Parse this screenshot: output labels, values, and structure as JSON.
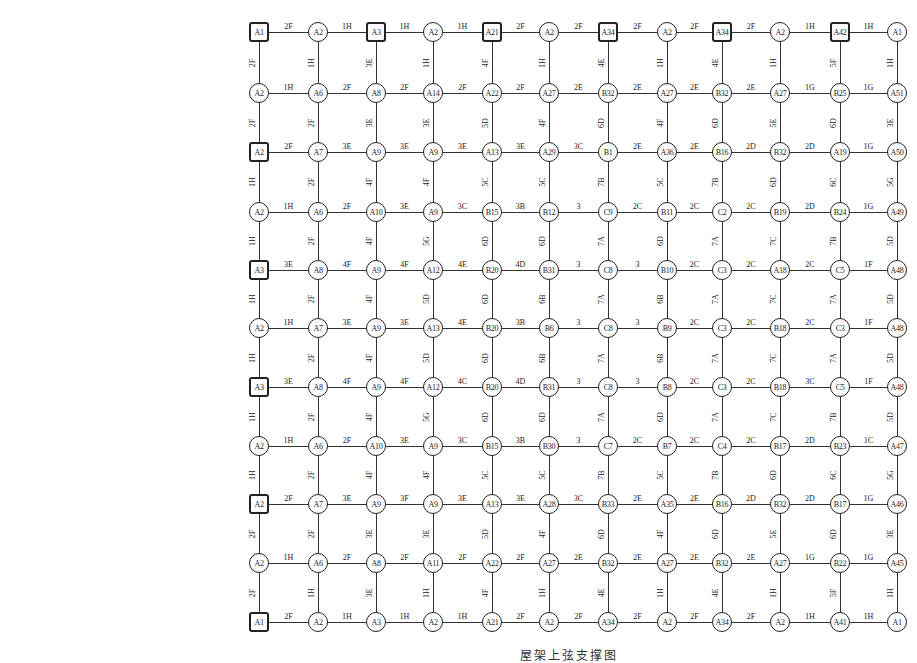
{
  "diagram": {
    "caption": "屋架上弦支撑图",
    "columns_x": [
      259,
      318,
      376,
      433,
      492,
      549,
      608,
      667,
      722,
      780,
      840,
      897
    ],
    "rows_y": [
      32,
      93,
      152,
      212,
      270,
      328,
      387,
      446,
      504,
      563,
      622
    ],
    "nodes": [
      [
        "A1",
        "A2",
        "A3",
        "A2",
        "A21",
        "A2",
        "A34",
        "A2",
        "A34",
        "A2",
        "A42",
        "A1"
      ],
      [
        "A2",
        "A6",
        "A8",
        "A14",
        "A22",
        "A27",
        "B32",
        "A27",
        "B32",
        "A27",
        "B25",
        "A51"
      ],
      [
        "A2",
        "A7",
        "A9",
        "A9",
        "A13",
        "A29",
        "B1",
        "A36",
        "B16",
        "B32",
        "A19",
        "A50"
      ],
      [
        "A2",
        "A6",
        "A10",
        "A9",
        "B15",
        "B12",
        "C9",
        "B11",
        "C2",
        "B19",
        "B24",
        "A49"
      ],
      [
        "A3",
        "A8",
        "A9",
        "A12",
        "B20",
        "B31",
        "C8",
        "B10",
        "C3",
        "A18",
        "C5",
        "A48"
      ],
      [
        "A2",
        "A7",
        "A9",
        "A13",
        "B20",
        "B6",
        "C8",
        "B9",
        "C3",
        "B18",
        "C3",
        "A48"
      ],
      [
        "A3",
        "A8",
        "A9",
        "A12",
        "B20",
        "B31",
        "C8",
        "B8",
        "C3",
        "B18",
        "C5",
        "A48"
      ],
      [
        "A2",
        "A6",
        "A10",
        "A9",
        "B15",
        "B30",
        "C7",
        "B7",
        "C4",
        "B17",
        "B23",
        "A47"
      ],
      [
        "A2",
        "A7",
        "A9",
        "A9",
        "A13",
        "A28",
        "B33",
        "A35",
        "B16",
        "B32",
        "B17",
        "A46"
      ],
      [
        "A2",
        "A6",
        "A8",
        "A11",
        "A22",
        "A27",
        "B32",
        "A27",
        "B32",
        "A27",
        "B22",
        "A45"
      ],
      [
        "A1",
        "A2",
        "A3",
        "A2",
        "A21",
        "A2",
        "A34",
        "A2",
        "A34",
        "A2",
        "A41",
        "A1"
      ]
    ],
    "square_nodes": [
      [
        0,
        0
      ],
      [
        0,
        2
      ],
      [
        0,
        4
      ],
      [
        0,
        6
      ],
      [
        0,
        8
      ],
      [
        0,
        10
      ],
      [
        2,
        0
      ],
      [
        4,
        0
      ],
      [
        6,
        0
      ],
      [
        8,
        0
      ],
      [
        10,
        0
      ]
    ],
    "h_labels": [
      [
        "2F",
        "1H",
        "1H",
        "1H",
        "2F",
        "2F",
        "2F",
        "2F",
        "2F",
        "1H",
        "1H"
      ],
      [
        "1H",
        "2F",
        "2F",
        "2F",
        "2F",
        "2E",
        "2E",
        "2E",
        "2E",
        "1G",
        "1G"
      ],
      [
        "2F",
        "3E",
        "3E",
        "3E",
        "3E",
        "3C",
        "2E",
        "2E",
        "2D",
        "2D",
        "1G"
      ],
      [
        "1H",
        "2F",
        "3E",
        "3C",
        "3B",
        "3",
        "2C",
        "2C",
        "2C",
        "2D",
        "1G"
      ],
      [
        "3E",
        "4F",
        "4F",
        "4E",
        "4D",
        "3",
        "3",
        "2C",
        "2C",
        "2C",
        "1F"
      ],
      [
        "1H",
        "3E",
        "3E",
        "4E",
        "3B",
        "3",
        "3",
        "2C",
        "2C",
        "2C",
        "1F"
      ],
      [
        "3E",
        "4F",
        "4F",
        "4C",
        "4D",
        "3",
        "3",
        "2C",
        "2C",
        "3C",
        "1F"
      ],
      [
        "1H",
        "2F",
        "3E",
        "3C",
        "3B",
        "3",
        "2C",
        "2C",
        "2C",
        "2D",
        "1C"
      ],
      [
        "2F",
        "3E",
        "3F",
        "3E",
        "3E",
        "3C",
        "2E",
        "2E",
        "2D",
        "2D",
        "1G"
      ],
      [
        "1H",
        "2F",
        "2F",
        "2F",
        "2F",
        "2E",
        "2E",
        "2E",
        "2E",
        "1G",
        "1G"
      ],
      [
        "2F",
        "1H",
        "1H",
        "1H",
        "2F",
        "2F",
        "2F",
        "2F",
        "2F",
        "1H",
        "1H"
      ]
    ],
    "v_labels": [
      [
        "2F",
        "1H",
        "3E",
        "1H",
        "4F",
        "1H",
        "4E",
        "1H",
        "4E",
        "1H",
        "5F",
        "1H"
      ],
      [
        "2F",
        "2F",
        "3E",
        "3E",
        "5D",
        "4F",
        "6D",
        "4F",
        "6D",
        "5E",
        "6D",
        "3E"
      ],
      [
        "1H",
        "2F",
        "4F",
        "4F",
        "5C",
        "5C",
        "7B",
        "5C",
        "7B",
        "6D",
        "6C",
        "5G"
      ],
      [
        "1H",
        "2F",
        "4F",
        "5G",
        "6D",
        "6D",
        "7A",
        "6D",
        "7A",
        "7C",
        "7B",
        "5D"
      ],
      [
        "1H",
        "2F",
        "4F",
        "5D",
        "6D",
        "6B",
        "7A",
        "6B",
        "7A",
        "7C",
        "7A",
        "5D"
      ],
      [
        "1H",
        "2F",
        "4F",
        "5D",
        "6D",
        "6B",
        "7A",
        "6B",
        "7A",
        "7C",
        "7A",
        "5D"
      ],
      [
        "1H",
        "2F",
        "4F",
        "5G",
        "6D",
        "6D",
        "7A",
        "6D",
        "7A",
        "7C",
        "7B",
        "5D"
      ],
      [
        "1H",
        "2F",
        "4F",
        "4F",
        "5C",
        "5C",
        "7B",
        "5C",
        "7B",
        "6D",
        "6C",
        "5G"
      ],
      [
        "2F",
        "2F",
        "3E",
        "3E",
        "5D",
        "4F",
        "6D",
        "4F",
        "6D",
        "5E",
        "6D",
        "3E"
      ],
      [
        "2F",
        "1H",
        "3E",
        "1H",
        "4F",
        "1H",
        "4E",
        "1H",
        "4E",
        "1H",
        "5F",
        "1H"
      ]
    ]
  }
}
